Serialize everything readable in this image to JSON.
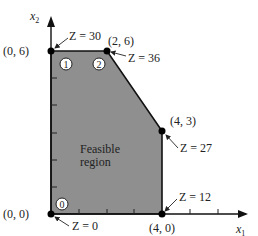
{
  "diagram": {
    "type": "feasible-region",
    "axes": {
      "x_label": "x",
      "x_sub": "1",
      "y_label": "x",
      "y_sub": "2"
    },
    "region_label": [
      "Feasible",
      "region"
    ],
    "region_color": "#8f8f8f",
    "vertices": [
      {
        "id": "v00",
        "coord": "(0, 0)",
        "z": "Z = 0"
      },
      {
        "id": "v06",
        "coord": "(0, 6)",
        "z": "Z = 30"
      },
      {
        "id": "v26",
        "coord": "(2, 6)",
        "z": "Z = 36"
      },
      {
        "id": "v43",
        "coord": "(4, 3)",
        "z": "Z = 27"
      },
      {
        "id": "v40",
        "coord": "(4, 0)",
        "z": "Z = 12"
      }
    ],
    "markers": [
      "0",
      "1",
      "2"
    ]
  }
}
